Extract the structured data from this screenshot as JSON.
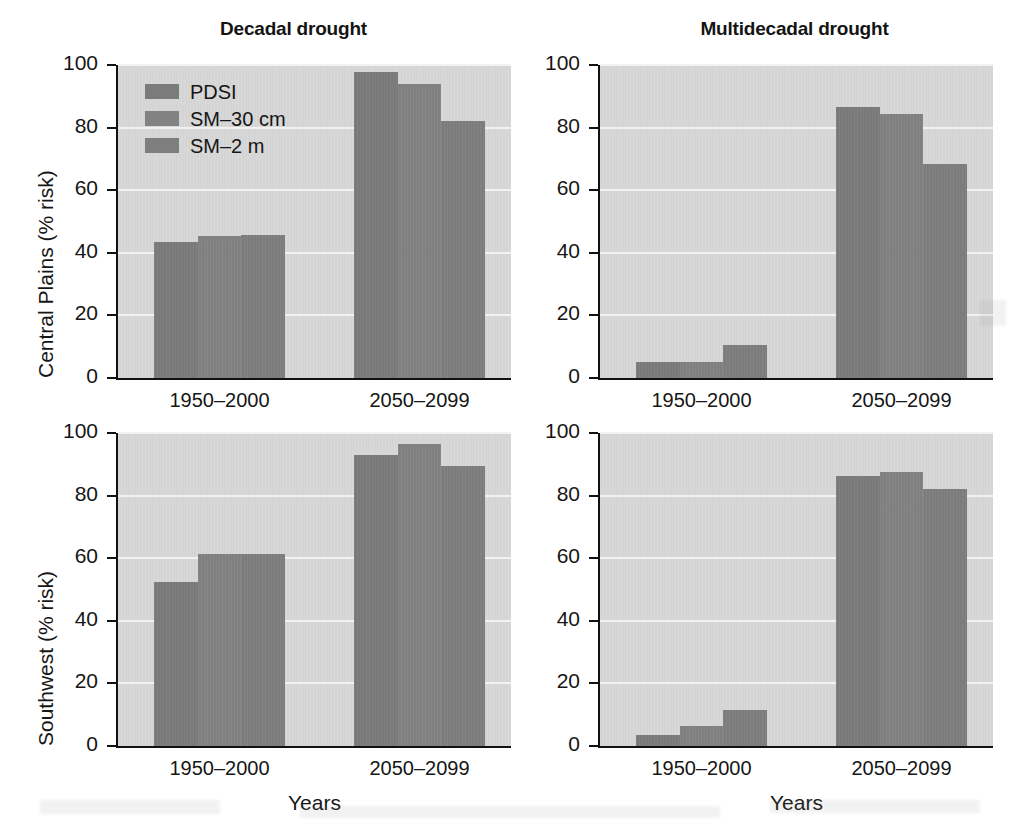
{
  "figure": {
    "ylabel_top": "Central Plains (% risk)",
    "ylabel_bottom": "Southwest (% risk)",
    "xlabel": "Years"
  },
  "legend": {
    "items": [
      {
        "label": "PDSI",
        "color": "#7b7b7b",
        "swatch_icon": "legend-swatch-pdsi"
      },
      {
        "label": "SM–30 cm",
        "color": "#828282",
        "swatch_icon": "legend-swatch-sm30"
      },
      {
        "label": "SM–2 m",
        "color": "#7e7e7e",
        "swatch_icon": "legend-swatch-sm2"
      }
    ]
  },
  "axis": {
    "yticks": [
      "0",
      "20",
      "40",
      "60",
      "80",
      "100"
    ],
    "xticks": [
      "1950–2000",
      "2050–2099"
    ],
    "ylim": [
      0,
      100
    ]
  },
  "colors": {
    "bar": "#7d7d7d",
    "plot_background": "#d7d7d7",
    "gridline": "#f2f2f2",
    "axis": "#111111",
    "text": "#161616"
  },
  "chart_data": [
    {
      "id": "central-plains-decadal",
      "type": "bar",
      "title": "Decadal drought",
      "row_label": "Central Plains (% risk)",
      "xlabel": "Years",
      "ylabel": "Central Plains (% risk)",
      "ylim": [
        0,
        100
      ],
      "grid": true,
      "legend_position": "top-left",
      "categories": [
        "1950–2000",
        "2050–2099"
      ],
      "series": [
        {
          "name": "PDSI",
          "values": [
            43.3,
            97.8
          ]
        },
        {
          "name": "SM–30 cm",
          "values": [
            45.3,
            93.8
          ]
        },
        {
          "name": "SM–2 m",
          "values": [
            45.6,
            82.2
          ]
        }
      ]
    },
    {
      "id": "central-plains-multidecadal",
      "type": "bar",
      "title": "Multidecadal drought",
      "row_label": "Central Plains (% risk)",
      "xlabel": "Years",
      "ylabel": "",
      "ylim": [
        0,
        100
      ],
      "grid": true,
      "legend_position": "none",
      "categories": [
        "1950–2000",
        "2050–2099"
      ],
      "series": [
        {
          "name": "PDSI",
          "values": [
            5.0,
            86.7
          ]
        },
        {
          "name": "SM–30 cm",
          "values": [
            5.0,
            84.3
          ]
        },
        {
          "name": "SM–2 m",
          "values": [
            10.5,
            68.4
          ]
        }
      ]
    },
    {
      "id": "southwest-decadal",
      "type": "bar",
      "title": "",
      "row_label": "Southwest (% risk)",
      "xlabel": "Years",
      "ylabel": "Southwest (% risk)",
      "ylim": [
        0,
        100
      ],
      "grid": true,
      "legend_position": "none",
      "categories": [
        "1950–2000",
        "2050–2099"
      ],
      "series": [
        {
          "name": "PDSI",
          "values": [
            52.4,
            93.0
          ]
        },
        {
          "name": "SM–30 cm",
          "values": [
            61.2,
            96.4
          ]
        },
        {
          "name": "SM–2 m",
          "values": [
            61.2,
            89.5
          ]
        }
      ]
    },
    {
      "id": "southwest-multidecadal",
      "type": "bar",
      "title": "",
      "row_label": "Southwest (% risk)",
      "xlabel": "Years",
      "ylabel": "",
      "ylim": [
        0,
        100
      ],
      "grid": true,
      "legend_position": "none",
      "categories": [
        "1950–2000",
        "2050–2099"
      ],
      "series": [
        {
          "name": "PDSI",
          "values": [
            3.6,
            86.4
          ]
        },
        {
          "name": "SM–30 cm",
          "values": [
            6.4,
            87.5
          ]
        },
        {
          "name": "SM–2 m",
          "values": [
            11.6,
            82.0
          ]
        }
      ]
    }
  ],
  "panels": {
    "top_left": {
      "title": "Decadal drought"
    },
    "top_right": {
      "title": "Multidecadal drought"
    },
    "bottom_left": {
      "title": ""
    },
    "bottom_right": {
      "title": ""
    }
  }
}
